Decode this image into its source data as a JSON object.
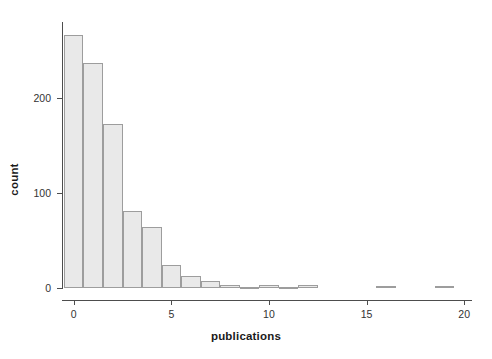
{
  "chart_data": {
    "type": "bar",
    "title": "",
    "subtitle": "",
    "xlabel": "publications",
    "ylabel": "count",
    "grid": false,
    "legend": null,
    "xlim": [
      -0.6,
      20.4
    ],
    "ylim": [
      0,
      280
    ],
    "xticks": [
      0,
      5,
      10,
      15,
      20
    ],
    "xtick_labels": [
      "0",
      "5",
      "10",
      "15",
      "20"
    ],
    "yticks": [
      0,
      100,
      200
    ],
    "ytick_labels": [
      "0",
      "100",
      "200"
    ],
    "bin_width": 1,
    "categories": [
      0,
      1,
      2,
      3,
      4,
      5,
      6,
      7,
      8,
      9,
      10,
      11,
      12,
      13,
      14,
      15,
      16,
      17,
      18,
      19
    ],
    "values": [
      266,
      237,
      173,
      81,
      64,
      24,
      13,
      7,
      3,
      1,
      3,
      1,
      3,
      0,
      0,
      0,
      2,
      0,
      0,
      2
    ],
    "bar_fill_color": "#e9e9e9",
    "bar_border_color": "#9d9d9d",
    "axis_color": "#4d4d4d",
    "text_color": "#1a1a1a",
    "background_color": "#ffffff"
  }
}
